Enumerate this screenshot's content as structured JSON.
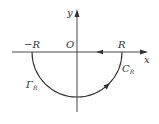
{
  "diagram": {
    "colors": {
      "stroke": "#333333",
      "background": "#ffffff"
    },
    "axes": {
      "x_label": "x",
      "y_label": "y",
      "origin_label": "O"
    },
    "points": {
      "neg_r": "−R",
      "pos_r": "R"
    },
    "curves": {
      "c_r": {
        "main": "C",
        "sub": "R"
      },
      "gamma_r": {
        "main": "Γ",
        "sub": "R"
      }
    }
  }
}
